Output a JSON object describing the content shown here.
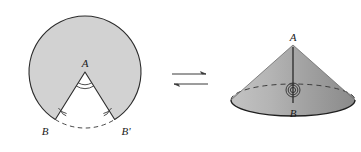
{
  "figure": {
    "background_color": "#ffffff",
    "equivalence_arrow": {
      "icon": "left-right-harpoons-icon",
      "symbol": "⇄",
      "direction": "bidirectional"
    }
  },
  "sector": {
    "name": "circular-sector-with-wedge-removed",
    "fill_color": "#d2d2d2",
    "stroke_color": "#2b2b2b",
    "center_label": "A",
    "left_vertex_label": "B",
    "right_vertex_label": "B'",
    "arc_dash_label": "",
    "angle_marker_count": 2,
    "center_x": 85,
    "center_y": 72,
    "radius": 56,
    "cut_start_deg": 238,
    "cut_end_deg": 302
  },
  "cone": {
    "name": "cone-figure",
    "apex_label": "A",
    "base_center_label": "B",
    "lateral_fill_light": "#b9b9b9",
    "lateral_fill_dark": "#8e8e8e",
    "base_fill": "#a6a6a6",
    "stroke_color": "#2b2b2b",
    "hidden_edge_style": "dashed",
    "angle_marker_count": 2,
    "apex_x": 293,
    "apex_y": 45,
    "base_center_x": 293,
    "base_center_y": 100,
    "base_rx": 62,
    "base_ry": 16
  },
  "labels": {
    "sector_A": "A",
    "sector_B": "B",
    "sector_Bprime": "B'",
    "cone_A": "A",
    "cone_B": "B"
  }
}
